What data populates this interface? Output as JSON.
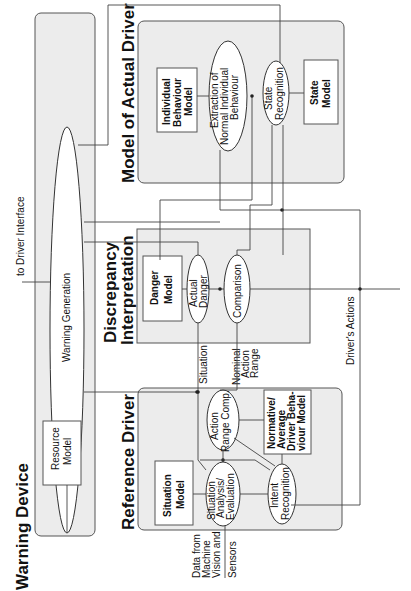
{
  "diagram": {
    "orientation": "rotated-90-ccw",
    "sections": {
      "warning_device": {
        "title": "Warning Device",
        "nodes": {
          "warning_generation": "Warning Generation",
          "resource_model": [
            "Resource",
            "Model"
          ]
        }
      },
      "model_of_actual_driver": {
        "title": "Model of Actual Driver",
        "nodes": {
          "individual_behaviour_model": [
            "Individual",
            "Behaviour",
            "Model"
          ],
          "extraction": [
            "Extraction of",
            "Normal Individual",
            "Behaviour"
          ],
          "state_recognition": [
            "State",
            "Recognition"
          ],
          "state_model": [
            "State",
            "Model"
          ]
        }
      },
      "discrepancy_interpretation": {
        "title": [
          "Discrepancy",
          "Interpretation"
        ],
        "nodes": {
          "danger_model": [
            "Danger",
            "Model"
          ],
          "actual_danger": [
            "Actual",
            "Danger"
          ],
          "comparison": "Comparison"
        }
      },
      "reference_driver": {
        "title": "Reference Driver",
        "nodes": {
          "situation_model": [
            "Situation",
            "Model"
          ],
          "situation_analysis": [
            "Situation",
            "Analysis/",
            "Evaluation"
          ],
          "action_range_comp": [
            "Action",
            "Range Comp."
          ],
          "normative_model": [
            "Normative/",
            "Average",
            "Driver Beha-",
            "viour Model"
          ],
          "intent_recognition": [
            "Intent",
            "Recognition"
          ]
        }
      }
    },
    "edge_labels": {
      "to_driver_interface": "to Driver Interface",
      "drivers_actions": "Driver's Actions",
      "situation": "Situation",
      "nominal_action_range": [
        "Nominal",
        "Action",
        "Range"
      ],
      "data_input": [
        "Data from",
        "Machine",
        "Vision and",
        "Sensors"
      ]
    },
    "colors": {
      "panel_fill": "#ececec",
      "line": "#444444"
    }
  }
}
